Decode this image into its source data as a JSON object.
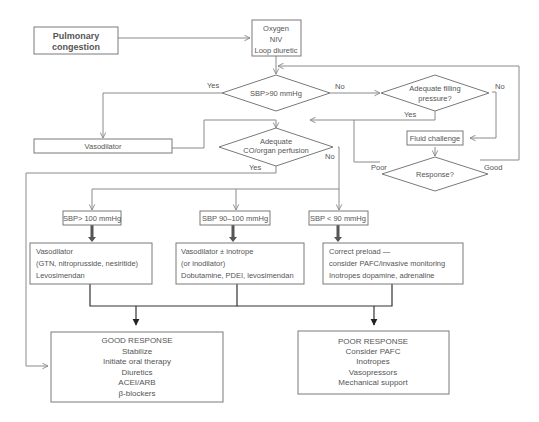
{
  "diagram": {
    "nodes": {
      "start": {
        "label_lines": [
          "Pulmonary",
          "congestion"
        ]
      },
      "initial": {
        "label_lines": [
          "Oxygen",
          "NIV",
          "Loop diuretic"
        ]
      },
      "sbp90": {
        "label": "SBP>90 mmHg"
      },
      "filling": {
        "label_lines": [
          "Adequate filling",
          "pressure?"
        ]
      },
      "vasodilator": {
        "label": "Vasodilator"
      },
      "perfusion": {
        "label_lines": [
          "Adequate",
          "CO/organ perfusion"
        ]
      },
      "fluid": {
        "label": "Fluid challenge"
      },
      "response": {
        "label": "Response?"
      },
      "sbp100": {
        "label": "SBP> 100 mmHg"
      },
      "sbp90_100": {
        "label": "SBP 90–100 mmHg"
      },
      "sbp_lt90": {
        "label": "SBP < 90 mmHg"
      },
      "treat1": {
        "label_lines": [
          "Vasodilator",
          "(GTN, nitroprusside, nesiritide)",
          "Levosimendan"
        ]
      },
      "treat2": {
        "label_lines": [
          "Vasodilator ± inotrope",
          "(or inodilator)",
          "Dobutamine, PDEI, levosimendan"
        ]
      },
      "treat3": {
        "label_lines": [
          "Correct preload —",
          "consider PAFC/invasive monitoring",
          "Inotropes dopamine, adrenaline"
        ]
      },
      "good": {
        "label_lines": [
          "GOOD RESPONSE",
          "Stabilize",
          "Initiate oral therapy",
          "Diuretics",
          "ACEI/ARB",
          "β-blockers"
        ]
      },
      "poor": {
        "label_lines": [
          "POOR RESPONSE",
          "Consider PAFC",
          "Inotropes",
          "Vasopressors",
          "Mechanical support"
        ]
      }
    },
    "edge_labels": {
      "sbp90_yes": "Yes",
      "sbp90_no": "No",
      "filling_no": "No",
      "filling_yes": "Yes",
      "perfusion_yes": "Yes",
      "perfusion_no": "No",
      "response_poor": "Poor",
      "response_good": "Good"
    }
  }
}
